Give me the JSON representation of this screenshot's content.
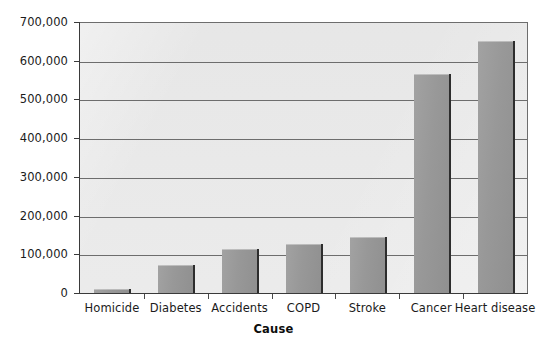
{
  "chart_data": {
    "type": "bar",
    "title": "",
    "subtitle": "",
    "xlabel": "Cause",
    "ylabel": "",
    "categories": [
      "Homicide",
      "Diabetes",
      "Accidents",
      "COPD",
      "Stroke",
      "Cancer",
      "Heart disease"
    ],
    "values": [
      13000,
      75000,
      116000,
      130000,
      147000,
      568000,
      653000
    ],
    "ylim": [
      0,
      700000
    ],
    "ytick_values": [
      0,
      100000,
      200000,
      300000,
      400000,
      500000,
      600000,
      700000
    ],
    "ytick_labels": [
      "0",
      "100,000",
      "200,000",
      "300,000",
      "400,000",
      "500,000",
      "600,000",
      "700,000"
    ],
    "grid": true,
    "grid_axis": "y",
    "legend": false,
    "legend_position": "none",
    "bar_color": "#989898",
    "bar_edge_color": "#2d2d2d",
    "plot_background": "#e7e7e7",
    "figure_background": "#ffffff",
    "axis_color": "#3a3a3a",
    "grid_color": "#6d6d6d",
    "text_color": "#1b1b1b"
  },
  "axis": {
    "x_title": "Cause"
  }
}
